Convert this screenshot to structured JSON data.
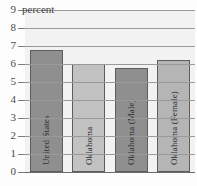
{
  "chart_data": {
    "type": "bar",
    "title": "",
    "subtitle": "",
    "xlabel": "",
    "ylabel": "percent",
    "unit_annotation": "percent",
    "ylim": [
      0,
      9
    ],
    "grid": true,
    "legend": "none",
    "categories": [
      "United States",
      "Oklahoma",
      "Oklahoma (Male)",
      "Oklahoma (Female)"
    ],
    "values": [
      6.8,
      6.0,
      5.8,
      6.25
    ],
    "ytick_labels": [
      "9",
      "8",
      "7",
      "6",
      "5",
      "4",
      "3",
      "2",
      "1",
      "0"
    ],
    "bar_colors": [
      "#8f8f8f",
      "#c2c2c2",
      "#8f8f8f",
      "#b5b5b5"
    ],
    "bar_border_color": "#5d5d5d",
    "gridline_color": "#9a9a9a",
    "plot_background": "#f2f2f2",
    "series": [
      {
        "name": "percent",
        "points": [
          {
            "category": "United States",
            "value": 6.8
          },
          {
            "category": "Oklahoma",
            "value": 6.0
          },
          {
            "category": "Oklahoma (Male)",
            "value": 5.8
          },
          {
            "category": "Oklahoma (Female)",
            "value": 6.25
          }
        ]
      }
    ]
  },
  "axis": {
    "y_max_label": "9",
    "ticks": [
      {
        "label": "9",
        "value": 9
      },
      {
        "label": "8",
        "value": 8
      },
      {
        "label": "7",
        "value": 7
      },
      {
        "label": "6",
        "value": 6
      },
      {
        "label": "5",
        "value": 5
      },
      {
        "label": "4",
        "value": 4
      },
      {
        "label": "3",
        "value": 3
      },
      {
        "label": "2",
        "value": 2
      },
      {
        "label": "1",
        "value": 1
      },
      {
        "label": "0",
        "value": 0
      }
    ]
  },
  "bars": [
    {
      "label": "United States",
      "value": 6.8,
      "color": "#8f8f8f"
    },
    {
      "label": "Oklahoma",
      "value": 6.0,
      "color": "#c2c2c2"
    },
    {
      "label": "Oklahoma (Male)",
      "value": 5.8,
      "color": "#8f8f8f"
    },
    {
      "label": "Oklahoma (Female)",
      "value": 6.25,
      "color": "#b5b5b5"
    }
  ]
}
